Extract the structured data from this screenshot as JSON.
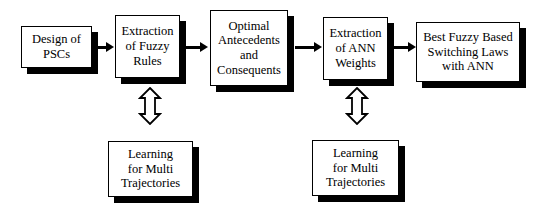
{
  "diagram": {
    "background_color": "#ffffff",
    "stroke_color": "#000000",
    "shadow_color": "#000000",
    "nodes": [
      {
        "id": "design-of-pscs",
        "label": "Design of\nPSCs"
      },
      {
        "id": "extraction-fuzzy-rules",
        "label": "Extraction\nof Fuzzy\nRules"
      },
      {
        "id": "optimal-antecedents",
        "label": "Optimal\nAntecedents\nand\nConsequents"
      },
      {
        "id": "extraction-ann-weights",
        "label": "Extraction\nof ANN\nWeights"
      },
      {
        "id": "best-fuzzy-switching",
        "label": "Best Fuzzy Based\nSwitching Laws\nwith ANN"
      },
      {
        "id": "learning-multi-trajectories-left",
        "label": "Learning\nfor Multi\nTrajectories"
      },
      {
        "id": "learning-multi-trajectories-right",
        "label": "Learning\nfor Multi\nTrajectories"
      }
    ],
    "connectors": [
      {
        "id": "arrow-design-to-fuzzy",
        "type": "solid-arrow",
        "direction": "right"
      },
      {
        "id": "arrow-fuzzy-to-optimal",
        "type": "solid-arrow",
        "direction": "right"
      },
      {
        "id": "arrow-optimal-to-ann",
        "type": "solid-arrow",
        "direction": "right"
      },
      {
        "id": "arrow-ann-to-best",
        "type": "solid-arrow",
        "direction": "right"
      },
      {
        "id": "arrow-fuzzy-learning-left",
        "type": "hollow-double-arrow",
        "direction": "vertical"
      },
      {
        "id": "arrow-ann-learning-right",
        "type": "hollow-double-arrow",
        "direction": "vertical"
      }
    ]
  }
}
